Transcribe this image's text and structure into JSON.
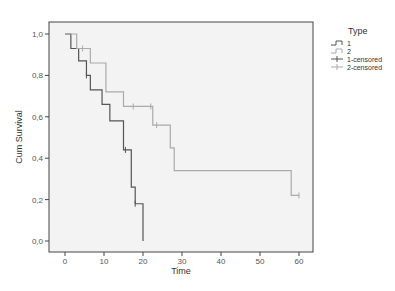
{
  "chart_data": {
    "type": "line",
    "subtype": "kaplan-meier step",
    "title": "",
    "xlabel": "Time",
    "ylabel": "Cum Survival",
    "xlim": [
      0,
      60
    ],
    "ylim": [
      0.0,
      1.0
    ],
    "x_ticks": [
      "0",
      "10",
      "20",
      "30",
      "40",
      "50",
      "60"
    ],
    "y_ticks": [
      "0,0",
      "0,2",
      "0,4",
      "0,6",
      "0,8",
      "1,0"
    ],
    "grid": false,
    "legend_position": "right",
    "legend_title": "Type",
    "legend": [
      "1",
      "2",
      "1-censored",
      "2-censored"
    ],
    "series": [
      {
        "name": "1",
        "color": "#555555",
        "steps": [
          [
            0,
            1.0
          ],
          [
            1.5,
            0.93
          ],
          [
            3.5,
            0.87
          ],
          [
            5.5,
            0.8
          ],
          [
            6.5,
            0.73
          ],
          [
            9.5,
            0.66
          ],
          [
            11.5,
            0.58
          ],
          [
            15,
            0.44
          ],
          [
            17,
            0.26
          ],
          [
            18,
            0.18
          ],
          [
            20,
            0.0
          ]
        ],
        "end_time": 20,
        "censored": [
          [
            5.5,
            0.8
          ],
          [
            15.5,
            0.44
          ],
          [
            18,
            0.18
          ]
        ]
      },
      {
        "name": "2",
        "color": "#aaaaaa",
        "steps": [
          [
            0,
            1.0
          ],
          [
            3,
            0.93
          ],
          [
            6.5,
            0.86
          ],
          [
            10.5,
            0.72
          ],
          [
            15,
            0.65
          ],
          [
            22.5,
            0.56
          ],
          [
            27,
            0.45
          ],
          [
            28,
            0.34
          ],
          [
            58,
            0.22
          ]
        ],
        "end_time": 60,
        "censored": [
          [
            4.5,
            0.93
          ],
          [
            17.5,
            0.65
          ],
          [
            22,
            0.65
          ],
          [
            23.5,
            0.56
          ],
          [
            60,
            0.22
          ]
        ]
      }
    ]
  },
  "legend": {
    "title": "Type",
    "items": [
      {
        "label": "1"
      },
      {
        "label": "2"
      },
      {
        "label": "1-censored"
      },
      {
        "label": "2-censored"
      }
    ]
  }
}
